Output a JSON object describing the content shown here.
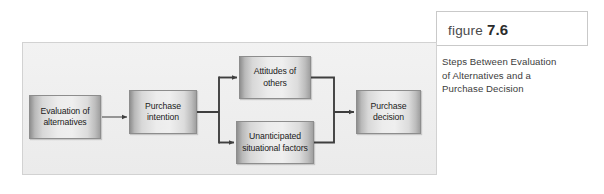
{
  "figure": {
    "header_label": "figure",
    "header_number": "7.6",
    "caption_lines": [
      "Steps Between Evaluation",
      "of Alternatives and a",
      "Purchase Decision"
    ]
  },
  "diagram": {
    "type": "flowchart",
    "boxes": [
      {
        "id": "evaluation",
        "line1": "Evaluation of",
        "line2": "alternatives"
      },
      {
        "id": "intention",
        "line1": "Purchase",
        "line2": "intention"
      },
      {
        "id": "attitudes",
        "line1": "Attitudes of",
        "line2": "others"
      },
      {
        "id": "unanticipated",
        "line1": "Unanticipated",
        "line2": "situational factors"
      },
      {
        "id": "decision",
        "line1": "Purchase",
        "line2": "decision"
      }
    ],
    "flow": [
      {
        "from": "evaluation",
        "to": "intention"
      },
      {
        "from": "intention",
        "to": "attitudes"
      },
      {
        "from": "intention",
        "to": "unanticipated"
      },
      {
        "from": "attitudes",
        "to": "decision"
      },
      {
        "from": "unanticipated",
        "to": "decision"
      }
    ]
  },
  "colors": {
    "panel_background": "#eeeeee",
    "panel_border": "#d2d2d2",
    "box_border": "#8d8d8d",
    "connector": "#3f3f3f",
    "header_border": "#c9c9c9",
    "caption_text": "#3c3c3c",
    "number_text": "#2b2b2b"
  }
}
